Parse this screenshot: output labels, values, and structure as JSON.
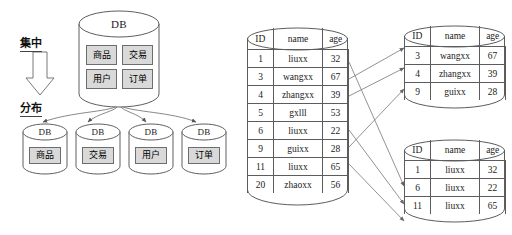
{
  "diagram": {
    "left_panel": {
      "caption_top": "集中",
      "caption_bottom": "分布",
      "arrow_icon": "down-arrow-icon",
      "central_db": {
        "label": "DB",
        "modules": [
          "商品",
          "交易",
          "用户",
          "订单"
        ]
      },
      "distributed_dbs": [
        {
          "label": "DB",
          "module": "商品"
        },
        {
          "label": "DB",
          "module": "交易"
        },
        {
          "label": "DB",
          "module": "用户"
        },
        {
          "label": "DB",
          "module": "订单"
        }
      ]
    },
    "right_panel": {
      "source_table": {
        "columns": [
          "ID",
          "name",
          "age"
        ],
        "rows": [
          [
            "1",
            "liuxx",
            "32"
          ],
          [
            "3",
            "wangxx",
            "67"
          ],
          [
            "4",
            "zhangxx",
            "39"
          ],
          [
            "5",
            "gxlll",
            "53"
          ],
          [
            "6",
            "liuxx",
            "22"
          ],
          [
            "9",
            "guixx",
            "28"
          ],
          [
            "11",
            "liuxx",
            "65"
          ],
          [
            "20",
            "zhaoxx",
            "56"
          ]
        ]
      },
      "shard_tables": [
        {
          "columns": [
            "ID",
            "name",
            "age"
          ],
          "rows": [
            [
              "3",
              "wangxx",
              "67"
            ],
            [
              "4",
              "zhangxx",
              "39"
            ],
            [
              "9",
              "guixx",
              "28"
            ]
          ]
        },
        {
          "columns": [
            "ID",
            "name",
            "age"
          ],
          "rows": [
            [
              "1",
              "liuxx",
              "32"
            ],
            [
              "6",
              "liuxx",
              "22"
            ],
            [
              "11",
              "liuxx",
              "65"
            ]
          ]
        }
      ]
    }
  }
}
